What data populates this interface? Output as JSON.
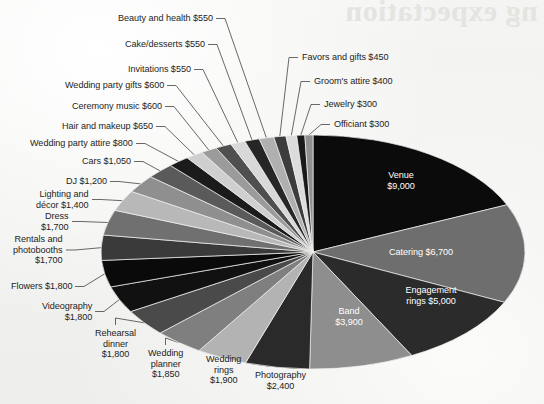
{
  "background": {
    "paper_color": "#f2f2f0",
    "bleed_through_text": "ng expectation",
    "bleed_through_color": "#e4e4e1"
  },
  "chart_data": {
    "type": "pie",
    "title": "",
    "currency": "$",
    "center": {
      "x": 313,
      "y": 252
    },
    "radius": {
      "x": 212,
      "y": 117
    },
    "start_angle_deg": 0,
    "direction": "clockwise",
    "total": 52150,
    "categories": [
      "Venue",
      "Catering",
      "Engagement rings",
      "Band",
      "Photography",
      "Wedding rings",
      "Wedding planner",
      "Rehearsal dinner",
      "Videography",
      "Flowers",
      "Rentals and photobooths",
      "Dress",
      "Lighting and décor",
      "DJ",
      "Cars",
      "Wedding party attire",
      "Hair and makeup",
      "Ceremony music",
      "Wedding party gifts",
      "Invitations",
      "Cake/desserts",
      "Beauty and health",
      "Favors and gifts",
      "Groom's attire",
      "Jewelry",
      "Officiant"
    ],
    "values": [
      9000,
      6700,
      5000,
      3900,
      2400,
      1900,
      1850,
      1800,
      1800,
      1800,
      1700,
      1700,
      1400,
      1200,
      1050,
      800,
      650,
      600,
      600,
      550,
      550,
      550,
      450,
      400,
      300,
      300
    ],
    "value_labels": [
      "$9,000",
      "$6,700",
      "$5,000",
      "$3,900",
      "$2,400",
      "$1,900",
      "$1,850",
      "$1,800",
      "$1,800",
      "$1,800",
      "$1,700",
      "$1,700",
      "$1,400",
      "$1,200",
      "$1,050",
      "$800",
      "$650",
      "$600",
      "$600",
      "$550",
      "$550",
      "$550",
      "$450",
      "$400",
      "$300",
      "$300"
    ],
    "colors": [
      "#0b0b0b",
      "#6e6e6e",
      "#2b2b2b",
      "#8e8e8e",
      "#2a2a2a",
      "#b3b3b3",
      "#7f7f7f",
      "#4a4a4a",
      "#111111",
      "#0a0a0a",
      "#3a3a3a",
      "#707070",
      "#b8b8b8",
      "#8f8f8f",
      "#5a5a5a",
      "#1b1b1b",
      "#cfcfcf",
      "#9b9b9b",
      "#4f4f4f",
      "#d8d8d8",
      "#262626",
      "#b0b0b0",
      "#3c3c3c",
      "#dcdcdc",
      "#1a1a1a",
      "#909090"
    ],
    "legend": "none",
    "labels_inside": [
      {
        "category": "Venue",
        "text": "Venue\n$9,000",
        "x": 401,
        "y": 181
      },
      {
        "category": "Catering",
        "text": "Catering $6,700",
        "x": 421,
        "y": 252
      },
      {
        "category": "Engagement rings",
        "text": "Engagement\nrings $5,000",
        "x": 431,
        "y": 296
      },
      {
        "category": "Band",
        "text": "Band\n$3,900",
        "x": 349,
        "y": 317
      }
    ],
    "labels_outside": [
      {
        "category": "Beauty and health",
        "text": "Beauty and health $550",
        "x": 118,
        "y": 13,
        "align": "right"
      },
      {
        "category": "Cake/desserts",
        "text": "Cake/desserts $550",
        "x": 125,
        "y": 39,
        "align": "right"
      },
      {
        "category": "Invitations",
        "text": "Invitations $550",
        "x": 128,
        "y": 64,
        "align": "right"
      },
      {
        "category": "Wedding party gifts",
        "text": "Wedding party gifts $600",
        "x": 65,
        "y": 80,
        "align": "right"
      },
      {
        "category": "Ceremony music",
        "text": "Ceremony music $600",
        "x": 72,
        "y": 101,
        "align": "right"
      },
      {
        "category": "Hair and makeup",
        "text": "Hair and makeup $650",
        "x": 62,
        "y": 121,
        "align": "right"
      },
      {
        "category": "Wedding party attire",
        "text": "Wedding party attire $800",
        "x": 30,
        "y": 138,
        "align": "right"
      },
      {
        "category": "Cars",
        "text": "Cars $1,050",
        "x": 82,
        "y": 156,
        "align": "right"
      },
      {
        "category": "DJ",
        "text": "DJ $1,200",
        "x": 66,
        "y": 176,
        "align": "right"
      },
      {
        "category": "Lighting and décor",
        "text": "Lighting and\ndécor $1,400",
        "x": 36,
        "y": 189,
        "align": "right"
      },
      {
        "category": "Dress",
        "text": "Dress\n$1,700",
        "x": 41,
        "y": 211,
        "align": "right"
      },
      {
        "category": "Rentals and photobooths",
        "text": "Rentals and\nphotobooths\n$1,700",
        "x": 13,
        "y": 234,
        "align": "right"
      },
      {
        "category": "Flowers",
        "text": "Flowers $1,800",
        "x": 11,
        "y": 281,
        "align": "right"
      },
      {
        "category": "Videography",
        "text": "Videography\n$1,800",
        "x": 42,
        "y": 301,
        "align": "right"
      },
      {
        "category": "Rehearsal dinner",
        "text": "Rehearsal\ndinner\n$1,800",
        "x": 95,
        "y": 328,
        "align": "center"
      },
      {
        "category": "Wedding planner",
        "text": "Wedding\nplanner\n$1,850",
        "x": 148,
        "y": 348,
        "align": "center"
      },
      {
        "category": "Wedding rings",
        "text": "Wedding\nrings\n$1,900",
        "x": 206,
        "y": 354,
        "align": "center"
      },
      {
        "category": "Photography",
        "text": "Photography\n$2,400",
        "x": 255,
        "y": 370,
        "align": "center"
      },
      {
        "category": "Favors and gifts",
        "text": "Favors and gifts $450",
        "x": 302,
        "y": 52,
        "align": "left"
      },
      {
        "category": "Groom's attire",
        "text": "Groom's attire $400",
        "x": 314,
        "y": 76,
        "align": "left"
      },
      {
        "category": "Jewelry",
        "text": "Jewelry $300",
        "x": 324,
        "y": 99,
        "align": "left"
      },
      {
        "category": "Officiant",
        "text": "Officiant $300",
        "x": 334,
        "y": 119,
        "align": "left"
      }
    ]
  }
}
